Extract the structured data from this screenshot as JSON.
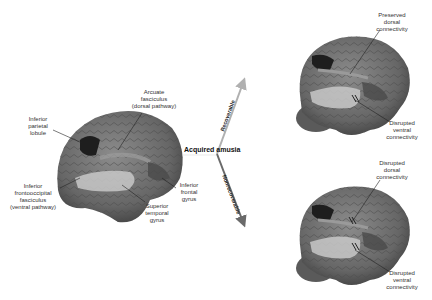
{
  "center": {
    "title": "Acquired amusia"
  },
  "arrows": {
    "up": {
      "label": "Recoverable",
      "color": "#b0b0b0"
    },
    "down": {
      "label": "Nonrecoverable",
      "color": "#6a6a6a"
    }
  },
  "left_brain": {
    "labels": {
      "arcuate": "Arcuate\nfasciculus\n(dorsal pathway)",
      "ipl": "Inferior\nparietal\nlobule",
      "ifof": "Inferior\nfrontooccipital\nfasciculus\n(ventral pathway)",
      "stg": "Superior\ntemporal\ngyrus",
      "ifg": "Inferior\nfrontal\ngyrus"
    }
  },
  "top_right_brain": {
    "labels": {
      "dorsal": "Preserved\ndorsal\nconnectivity",
      "ventral": "Disrupted\nventral\nconnectivity"
    }
  },
  "bottom_right_brain": {
    "labels": {
      "dorsal": "Disrupted\ndorsal\nconnectivity",
      "ventral": "Disrupted\nventral\nconnectivity"
    }
  },
  "colors": {
    "brain": "#6f6f6f",
    "lesion": "#1e1e1e",
    "ventral_tract": "#c8c8c8",
    "dorsal_tract": "#9a9a9a",
    "frontal_region": "#4a4a4a"
  }
}
